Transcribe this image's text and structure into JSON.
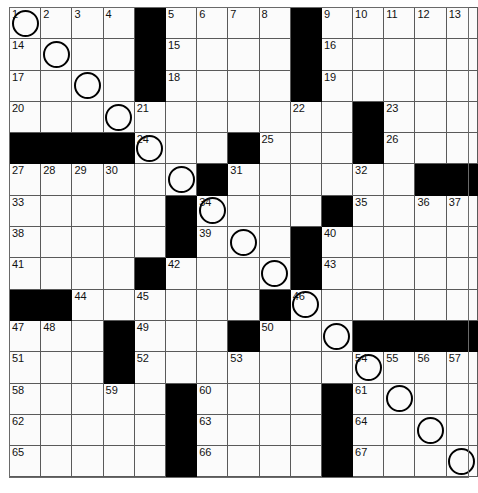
{
  "puzzle": {
    "title": "Crossword Grid",
    "columns": 13,
    "rows": 15,
    "colors": {
      "block": "#000000",
      "cell": "#fbfbfb",
      "gridline": "#5a5a5a",
      "number": "#111111",
      "circle": "#000000"
    },
    "legend": {
      "block_label": "block",
      "circle_label": "circled-cell",
      "open_label": "open-cell"
    },
    "grid": [
      [
        {
          "t": "o",
          "n": "1",
          "c": true
        },
        {
          "t": "o",
          "n": "2"
        },
        {
          "t": "o",
          "n": "3"
        },
        {
          "t": "o",
          "n": "4"
        },
        {
          "t": "b"
        },
        {
          "t": "o",
          "n": "5"
        },
        {
          "t": "o",
          "n": "6"
        },
        {
          "t": "o",
          "n": "7"
        },
        {
          "t": "o",
          "n": "8"
        },
        {
          "t": "b"
        },
        {
          "t": "o",
          "n": "9"
        },
        {
          "t": "o",
          "n": "10"
        },
        {
          "t": "o",
          "n": "11"
        },
        {
          "t": "o",
          "n": "12"
        },
        {
          "t": "o",
          "n": "13"
        }
      ],
      [
        {
          "t": "o",
          "n": "14"
        },
        {
          "t": "o",
          "c": true
        },
        {
          "t": "o"
        },
        {
          "t": "o"
        },
        {
          "t": "b"
        },
        {
          "t": "o",
          "n": "15"
        },
        {
          "t": "o"
        },
        {
          "t": "o"
        },
        {
          "t": "o"
        },
        {
          "t": "b"
        },
        {
          "t": "o",
          "n": "16"
        },
        {
          "t": "o"
        },
        {
          "t": "o"
        },
        {
          "t": "o"
        },
        {
          "t": "o"
        }
      ],
      [
        {
          "t": "o",
          "n": "17"
        },
        {
          "t": "o"
        },
        {
          "t": "o",
          "c": true
        },
        {
          "t": "o"
        },
        {
          "t": "b"
        },
        {
          "t": "o",
          "n": "18"
        },
        {
          "t": "o"
        },
        {
          "t": "o"
        },
        {
          "t": "o"
        },
        {
          "t": "b"
        },
        {
          "t": "o",
          "n": "19"
        },
        {
          "t": "o"
        },
        {
          "t": "o"
        },
        {
          "t": "o"
        },
        {
          "t": "o"
        }
      ],
      [
        {
          "t": "o",
          "n": "20"
        },
        {
          "t": "o"
        },
        {
          "t": "o"
        },
        {
          "t": "o",
          "c": true
        },
        {
          "t": "o",
          "n": "21"
        },
        {
          "t": "o"
        },
        {
          "t": "o"
        },
        {
          "t": "o"
        },
        {
          "t": "o"
        },
        {
          "t": "o",
          "n": "22"
        },
        {
          "t": "o"
        },
        {
          "t": "b"
        },
        {
          "t": "o",
          "n": "23"
        },
        {
          "t": "o"
        },
        {
          "t": "o"
        }
      ],
      [
        {
          "t": "b"
        },
        {
          "t": "b"
        },
        {
          "t": "b"
        },
        {
          "t": "b"
        },
        {
          "t": "o",
          "n": "24",
          "c": true
        },
        {
          "t": "o"
        },
        {
          "t": "o"
        },
        {
          "t": "b"
        },
        {
          "t": "o",
          "n": "25"
        },
        {
          "t": "o"
        },
        {
          "t": "o"
        },
        {
          "t": "b"
        },
        {
          "t": "o",
          "n": "26"
        },
        {
          "t": "o"
        },
        {
          "t": "o"
        }
      ],
      [
        {
          "t": "o",
          "n": "27"
        },
        {
          "t": "o",
          "n": "28"
        },
        {
          "t": "o",
          "n": "29"
        },
        {
          "t": "o",
          "n": "30"
        },
        {
          "t": "o"
        },
        {
          "t": "o",
          "c": true
        },
        {
          "t": "b"
        },
        {
          "t": "o",
          "n": "31"
        },
        {
          "t": "o"
        },
        {
          "t": "o"
        },
        {
          "t": "o"
        },
        {
          "t": "o",
          "n": "32"
        },
        {
          "t": "o"
        },
        {
          "t": "b"
        },
        {
          "t": "b"
        }
      ],
      [
        {
          "t": "o",
          "n": "33"
        },
        {
          "t": "o"
        },
        {
          "t": "o"
        },
        {
          "t": "o"
        },
        {
          "t": "o"
        },
        {
          "t": "b"
        },
        {
          "t": "o",
          "n": "34",
          "c": true
        },
        {
          "t": "o"
        },
        {
          "t": "o"
        },
        {
          "t": "o"
        },
        {
          "t": "b"
        },
        {
          "t": "o",
          "n": "35"
        },
        {
          "t": "o"
        },
        {
          "t": "o",
          "n": "36"
        },
        {
          "t": "o",
          "n": "37"
        }
      ],
      [
        {
          "t": "o",
          "n": "38"
        },
        {
          "t": "o"
        },
        {
          "t": "o"
        },
        {
          "t": "o"
        },
        {
          "t": "o"
        },
        {
          "t": "b"
        },
        {
          "t": "o",
          "n": "39"
        },
        {
          "t": "o",
          "c": true
        },
        {
          "t": "o"
        },
        {
          "t": "b"
        },
        {
          "t": "o",
          "n": "40"
        },
        {
          "t": "o"
        },
        {
          "t": "o"
        },
        {
          "t": "o"
        },
        {
          "t": "o"
        }
      ],
      [
        {
          "t": "o",
          "n": "41"
        },
        {
          "t": "o"
        },
        {
          "t": "o"
        },
        {
          "t": "o"
        },
        {
          "t": "b"
        },
        {
          "t": "o",
          "n": "42"
        },
        {
          "t": "o"
        },
        {
          "t": "o"
        },
        {
          "t": "o",
          "c": true
        },
        {
          "t": "b"
        },
        {
          "t": "o",
          "n": "43"
        },
        {
          "t": "o"
        },
        {
          "t": "o"
        },
        {
          "t": "o"
        },
        {
          "t": "o"
        }
      ],
      [
        {
          "t": "b"
        },
        {
          "t": "b"
        },
        {
          "t": "o",
          "n": "44"
        },
        {
          "t": "o"
        },
        {
          "t": "o",
          "n": "45"
        },
        {
          "t": "o"
        },
        {
          "t": "o"
        },
        {
          "t": "o"
        },
        {
          "t": "b"
        },
        {
          "t": "o",
          "n": "46",
          "c": true
        },
        {
          "t": "o"
        },
        {
          "t": "o"
        },
        {
          "t": "o"
        },
        {
          "t": "o"
        },
        {
          "t": "o"
        }
      ],
      [
        {
          "t": "o",
          "n": "47"
        },
        {
          "t": "o",
          "n": "48"
        },
        {
          "t": "o"
        },
        {
          "t": "b"
        },
        {
          "t": "o",
          "n": "49"
        },
        {
          "t": "o"
        },
        {
          "t": "o"
        },
        {
          "t": "b"
        },
        {
          "t": "o",
          "n": "50"
        },
        {
          "t": "o"
        },
        {
          "t": "o",
          "c": true
        },
        {
          "t": "b"
        },
        {
          "t": "b"
        },
        {
          "t": "b"
        },
        {
          "t": "b"
        }
      ],
      [
        {
          "t": "o",
          "n": "51"
        },
        {
          "t": "o"
        },
        {
          "t": "o"
        },
        {
          "t": "b"
        },
        {
          "t": "o",
          "n": "52"
        },
        {
          "t": "o"
        },
        {
          "t": "o"
        },
        {
          "t": "o",
          "n": "53"
        },
        {
          "t": "o"
        },
        {
          "t": "o"
        },
        {
          "t": "o"
        },
        {
          "t": "o",
          "n": "54",
          "c": true
        },
        {
          "t": "o",
          "n": "55"
        },
        {
          "t": "o",
          "n": "56"
        },
        {
          "t": "o",
          "n": "57"
        }
      ],
      [
        {
          "t": "o",
          "n": "58"
        },
        {
          "t": "o"
        },
        {
          "t": "o"
        },
        {
          "t": "o",
          "n": "59"
        },
        {
          "t": "o"
        },
        {
          "t": "b"
        },
        {
          "t": "o",
          "n": "60"
        },
        {
          "t": "o"
        },
        {
          "t": "o"
        },
        {
          "t": "o"
        },
        {
          "t": "b"
        },
        {
          "t": "o",
          "n": "61"
        },
        {
          "t": "o",
          "c": true
        },
        {
          "t": "o"
        },
        {
          "t": "o"
        }
      ],
      [
        {
          "t": "o",
          "n": "62"
        },
        {
          "t": "o"
        },
        {
          "t": "o"
        },
        {
          "t": "o"
        },
        {
          "t": "o"
        },
        {
          "t": "b"
        },
        {
          "t": "o",
          "n": "63"
        },
        {
          "t": "o"
        },
        {
          "t": "o"
        },
        {
          "t": "o"
        },
        {
          "t": "b"
        },
        {
          "t": "o",
          "n": "64"
        },
        {
          "t": "o"
        },
        {
          "t": "o",
          "c": true
        },
        {
          "t": "o"
        }
      ],
      [
        {
          "t": "o",
          "n": "65"
        },
        {
          "t": "o"
        },
        {
          "t": "o"
        },
        {
          "t": "o"
        },
        {
          "t": "o"
        },
        {
          "t": "b"
        },
        {
          "t": "o",
          "n": "66"
        },
        {
          "t": "o"
        },
        {
          "t": "o"
        },
        {
          "t": "o"
        },
        {
          "t": "b"
        },
        {
          "t": "o",
          "n": "67"
        },
        {
          "t": "o"
        },
        {
          "t": "o"
        },
        {
          "t": "o",
          "c": true
        }
      ]
    ]
  }
}
